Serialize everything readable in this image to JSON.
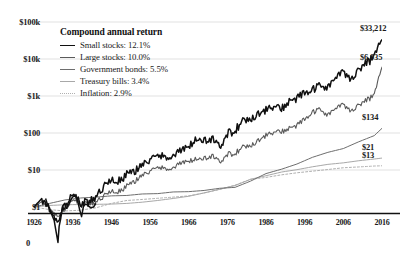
{
  "chart_data": {
    "type": "line",
    "title": "",
    "subtitle": "",
    "xlabel": "",
    "ylabel": "",
    "scale": "log",
    "grid": true,
    "legend_position": "upper-left-inside",
    "xlim": [
      1926,
      2016
    ],
    "ylim": [
      1,
      100000
    ],
    "ytick_labels": [
      "$100k",
      "$10k",
      "$1k",
      "$100",
      "$10",
      "$1"
    ],
    "ytick_values": [
      100000,
      10000,
      1000,
      100,
      10,
      1
    ],
    "xtick_labels": [
      "1926",
      "1936",
      "1946",
      "1956",
      "1966",
      "1976",
      "1986",
      "1996",
      "2006",
      "2016"
    ],
    "xtick_values": [
      1926,
      1936,
      1946,
      1956,
      1966,
      1976,
      1986,
      1996,
      2006,
      2016
    ],
    "zero_annotation": "0",
    "legend_title": "Compound annual return",
    "series": [
      {
        "name": "Small stocks",
        "annual_return": "12.1%",
        "legend_label": "Small stocks: 12.1%",
        "end_value_label": "$33,212",
        "end_value": 33212,
        "color": "#101010",
        "width": 1.5,
        "dash": "none",
        "x": [
          1926,
          1928,
          1930,
          1932,
          1934,
          1936,
          1938,
          1940,
          1942,
          1944,
          1946,
          1948,
          1950,
          1952,
          1954,
          1956,
          1958,
          1960,
          1962,
          1964,
          1966,
          1968,
          1970,
          1972,
          1974,
          1976,
          1978,
          1980,
          1982,
          1984,
          1986,
          1988,
          1990,
          1992,
          1994,
          1996,
          1998,
          2000,
          2002,
          2004,
          2006,
          2008,
          2010,
          2012,
          2014,
          2016
        ],
        "values": [
          1,
          1.7,
          0.95,
          0.38,
          1.15,
          2.1,
          1.3,
          1.35,
          1.9,
          3.6,
          5.2,
          5.0,
          7.4,
          9.2,
          15.0,
          17.5,
          24.0,
          24.5,
          23.0,
          34.0,
          40.0,
          72.0,
          58.0,
          72.0,
          42.0,
          95.0,
          120.0,
          200.0,
          250.0,
          330.0,
          420.0,
          520.0,
          430.0,
          760.0,
          830.0,
          1250.0,
          1400.0,
          1900.0,
          1750.0,
          3200.0,
          4200.0,
          2900.0,
          5600.0,
          7800.0,
          11500.0,
          33212.0
        ]
      },
      {
        "name": "Large stocks",
        "annual_return": "10.0%",
        "legend_label": "Large stocks: 10.0%",
        "end_value_label": "$6,035",
        "end_value": 6035,
        "color": "#5a5a5a",
        "width": 1.1,
        "dash": "none",
        "x": [
          1926,
          1928,
          1930,
          1932,
          1934,
          1936,
          1938,
          1940,
          1942,
          1944,
          1946,
          1948,
          1950,
          1952,
          1954,
          1956,
          1958,
          1960,
          1962,
          1964,
          1966,
          1968,
          1970,
          1972,
          1974,
          1976,
          1978,
          1980,
          1982,
          1984,
          1986,
          1988,
          1990,
          1992,
          1994,
          1996,
          1998,
          2000,
          2002,
          2004,
          2006,
          2008,
          2010,
          2012,
          2014,
          2016
        ],
        "values": [
          1,
          1.4,
          0.95,
          0.55,
          0.9,
          1.5,
          1.2,
          1.2,
          1.35,
          2.0,
          2.6,
          2.6,
          3.6,
          4.9,
          7.6,
          8.8,
          11.5,
          11.6,
          11.0,
          15.5,
          16.5,
          20.5,
          19.5,
          24.5,
          16.5,
          26.5,
          28.5,
          40.0,
          47.0,
          63.0,
          86.0,
          105.0,
          105.0,
          140.0,
          155.0,
          240.0,
          350.0,
          430.0,
          310.0,
          470.0,
          560.0,
          400.0,
          600.0,
          760.0,
          1050.0,
          6035.0
        ]
      },
      {
        "name": "Government bonds",
        "annual_return": "5.5%",
        "legend_label": "Government bonds: 5.5%",
        "end_value_label": "$134",
        "end_value": 134,
        "color": "#6e6e6e",
        "width": 1.0,
        "dash": "none",
        "x": [
          1926,
          1930,
          1934,
          1938,
          1942,
          1946,
          1950,
          1954,
          1958,
          1962,
          1966,
          1970,
          1974,
          1978,
          1982,
          1986,
          1990,
          1994,
          1998,
          2002,
          2006,
          2010,
          2014,
          2016
        ],
        "values": [
          1,
          1.25,
          1.55,
          1.75,
          1.85,
          2.0,
          2.05,
          2.25,
          2.3,
          2.55,
          2.6,
          2.8,
          3.2,
          3.4,
          5.0,
          8.0,
          10.5,
          14.5,
          22.0,
          30.0,
          38.0,
          58.0,
          85.0,
          134.0
        ]
      },
      {
        "name": "Treasury bills",
        "annual_return": "3.4%",
        "legend_label": "Treasury bills: 3.4%",
        "end_value_label": "$21",
        "end_value": 21,
        "color": "#a8a8a8",
        "width": 1.0,
        "dash": "none",
        "x": [
          1926,
          1930,
          1934,
          1938,
          1942,
          1946,
          1950,
          1954,
          1958,
          1962,
          1966,
          1970,
          1974,
          1978,
          1982,
          1986,
          1990,
          1994,
          1998,
          2002,
          2006,
          2010,
          2014,
          2016
        ],
        "values": [
          1,
          1.1,
          1.15,
          1.17,
          1.18,
          1.2,
          1.25,
          1.35,
          1.5,
          1.7,
          1.95,
          2.4,
          3.0,
          3.8,
          5.6,
          7.0,
          8.8,
          10.2,
          12.2,
          14.2,
          15.6,
          17.8,
          19.8,
          21.0
        ]
      },
      {
        "name": "Inflation",
        "annual_return": "2.9%",
        "legend_label": "Inflation: 2.9%",
        "end_value_label": "$13",
        "end_value": 13,
        "color": "#b0b0b0",
        "width": 1.0,
        "dash": "2,2",
        "x": [
          1926,
          1930,
          1934,
          1938,
          1942,
          1946,
          1950,
          1954,
          1958,
          1962,
          1966,
          1970,
          1974,
          1978,
          1982,
          1986,
          1990,
          1994,
          1998,
          2002,
          2006,
          2010,
          2014,
          2016
        ],
        "values": [
          1,
          0.85,
          0.78,
          0.82,
          0.95,
          1.25,
          1.5,
          1.6,
          1.72,
          1.85,
          2.0,
          2.4,
          3.0,
          3.9,
          5.6,
          6.3,
          7.4,
          8.4,
          9.3,
          10.3,
          11.5,
          12.1,
          12.8,
          13.0
        ]
      }
    ],
    "notes": {
      "depression_dip": "Small stocks series plunges below the $1 baseline during the early-1930s Depression, drawn extending past the axis."
    }
  }
}
